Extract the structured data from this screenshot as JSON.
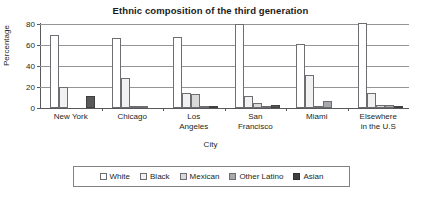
{
  "chart_data": {
    "type": "bar",
    "title": "Ethnic composition of the third generation",
    "xlabel": "City",
    "ylabel": "Percentage",
    "ylim": [
      0,
      80
    ],
    "yticks": [
      0,
      20,
      40,
      60,
      80
    ],
    "ytick_labels": [
      "0",
      "20",
      "40",
      "60",
      "80"
    ],
    "grid": true,
    "legend_position": "bottom",
    "categories": [
      "New York",
      "Chicago",
      "Los Angeles",
      "San Francisco",
      "Miami",
      "Elsewhere in the U.S"
    ],
    "category_lines": [
      [
        "New York"
      ],
      [
        "Chicago"
      ],
      [
        "Los",
        "Angeles"
      ],
      [
        "San",
        "Francisco"
      ],
      [
        "Miami"
      ],
      [
        "Elsewhere",
        "in the U.S"
      ]
    ],
    "series": [
      {
        "name": "White",
        "color": "#ffffff",
        "values": [
          70,
          67,
          68,
          80,
          61,
          81
        ]
      },
      {
        "name": "Black",
        "color": "#f1f1f1",
        "values": [
          20,
          29,
          14,
          11,
          31,
          14
        ]
      },
      {
        "name": "Mexican",
        "color": "#d9d9d9",
        "values": [
          0,
          2,
          13,
          5,
          1,
          3
        ]
      },
      {
        "name": "Other Latino",
        "color": "#a7a9ac",
        "values": [
          0,
          2,
          2,
          2,
          7,
          3
        ]
      },
      {
        "name": "Asian",
        "color": "#3f4042",
        "values": [
          11,
          0,
          2,
          3,
          0,
          2
        ]
      }
    ]
  },
  "legend": {
    "items": [
      {
        "label": "White"
      },
      {
        "label": "Black"
      },
      {
        "label": "Mexican"
      },
      {
        "label": "Other Latino"
      },
      {
        "label": "Asian"
      }
    ]
  }
}
